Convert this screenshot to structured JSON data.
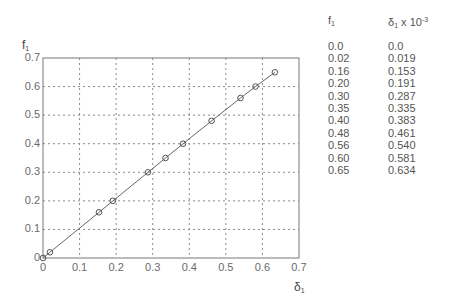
{
  "chart_data": {
    "type": "scatter",
    "title": "",
    "xlabel": "δ1",
    "ylabel": "f1",
    "xlim": [
      0,
      0.7
    ],
    "ylim": [
      0,
      0.7
    ],
    "grid": true,
    "x_ticks": [
      "0",
      "0.1",
      "0.2",
      "0.3",
      "0.4",
      "0.5",
      "0.6",
      "0.7"
    ],
    "y_ticks": [
      "0",
      "0.1",
      "0.2",
      "0.3",
      "0.4",
      "0.5",
      "0.6",
      "0.7"
    ],
    "series": [
      {
        "name": "measured",
        "marker": "circle",
        "line": true,
        "x": [
          0.0,
          0.019,
          0.153,
          0.191,
          0.287,
          0.335,
          0.383,
          0.461,
          0.54,
          0.581,
          0.634
        ],
        "y": [
          0.0,
          0.02,
          0.16,
          0.2,
          0.3,
          0.35,
          0.4,
          0.48,
          0.56,
          0.6,
          0.65
        ]
      }
    ]
  },
  "axis": {
    "xlabel_main": "δ",
    "xlabel_sub": "1",
    "ylabel_main": "f",
    "ylabel_sub": "1"
  },
  "table": {
    "col1_header_main": "f",
    "col1_header_sub": "1",
    "col2_header_main": "δ",
    "col2_header_sub": "1",
    "col2_header_suffix": " x 10",
    "col2_header_sup": "-3",
    "rows": [
      [
        "0.0",
        "0.0"
      ],
      [
        "0.02",
        "0.019"
      ],
      [
        "0.16",
        "0.153"
      ],
      [
        "0.20",
        "0.191"
      ],
      [
        "0.30",
        "0.287"
      ],
      [
        "0.35",
        "0.335"
      ],
      [
        "0.40",
        "0.383"
      ],
      [
        "0.48",
        "0.461"
      ],
      [
        "0.56",
        "0.540"
      ],
      [
        "0.60",
        "0.581"
      ],
      [
        "0.65",
        "0.634"
      ]
    ]
  },
  "colors": {
    "frame": "#777777",
    "grid": "#8a8a8a",
    "line": "#666666",
    "marker": "#555555"
  }
}
